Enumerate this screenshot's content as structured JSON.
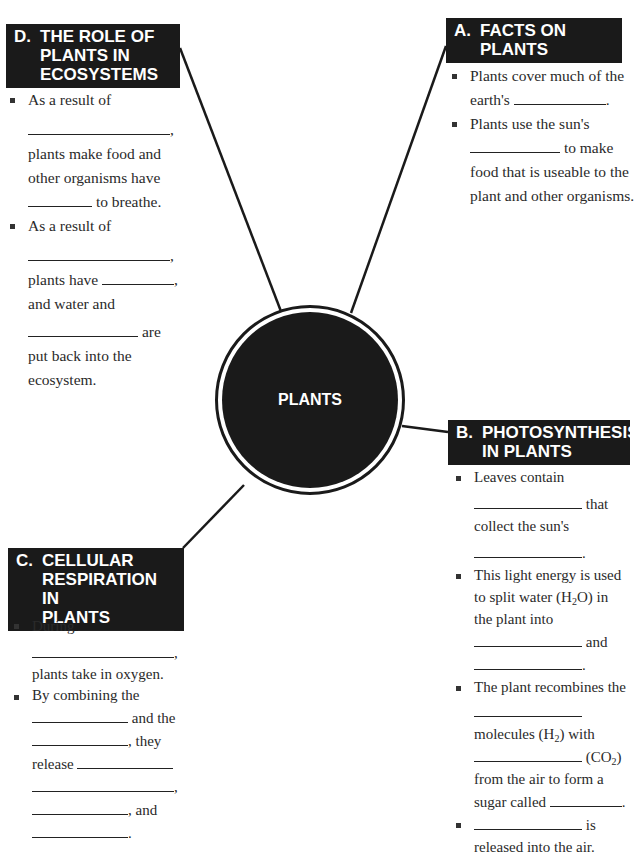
{
  "center": {
    "label": "PLANTS"
  },
  "sections": {
    "a": {
      "letter": "A.",
      "title_lines": [
        "FACTS ON",
        "PLANTS"
      ],
      "items": [
        {
          "line1": "Plants cover much of the",
          "line2_pre": "earth's",
          "line2_post": "."
        },
        {
          "line1": "Plants use the sun's",
          "line2_post": "to make",
          "line3": "food that is useable to the",
          "line4": "plant and other organisms."
        }
      ]
    },
    "b": {
      "letter": "B.",
      "title_lines": [
        "PHOTOSYNTHESIS",
        "IN PLANTS"
      ],
      "items": [
        {
          "line1": "Leaves contain",
          "line2_post": "that",
          "line3": "collect the sun's",
          "line4_post": "."
        },
        {
          "line1": "This light energy is used",
          "line2_pre": "to split water (H",
          "line2_sub": "2",
          "line2_post": "O) in",
          "line3": "the plant into",
          "line4_post": "and",
          "line5_post": "."
        },
        {
          "line1": "The plant recombines the",
          "line3_pre": "molecules (H",
          "line3_sub": "2",
          "line3_post": ") with",
          "line4_pre": "(CO",
          "line4_sub": "2",
          "line4_post": ")",
          "line5": "from the air to form a",
          "line6_pre": "sugar called",
          "line6_post": "."
        },
        {
          "line1_post": "is",
          "line2": "released into the air."
        }
      ]
    },
    "c": {
      "letter": "C.",
      "title_lines": [
        "CELLULAR",
        "RESPIRATION IN",
        "PLANTS"
      ],
      "items": [
        {
          "line1_pre": "During",
          "line2_post": ",",
          "line3": "plants take in oxygen."
        },
        {
          "line1": "By combining the",
          "line2_post": "and the",
          "line3_post": ", they",
          "line4_pre": "release",
          "line5_post": ",",
          "line6_post": ", and",
          "line7_post": "."
        }
      ]
    },
    "d": {
      "letter": "D.",
      "title_lines": [
        "THE ROLE OF",
        "PLANTS IN",
        "ECOSYSTEMS"
      ],
      "items": [
        {
          "line1": "As a result of",
          "line2_post": ",",
          "line3": "plants make food and",
          "line4": "other organisms have",
          "line5_post": "to breathe."
        },
        {
          "line1": "As a result of",
          "line2_post": ",",
          "line3_pre": "plants have",
          "line3_post": ",",
          "line4": "and water and",
          "line5_post": "are",
          "line6": "put back into the",
          "line7": "ecosystem."
        }
      ]
    }
  }
}
